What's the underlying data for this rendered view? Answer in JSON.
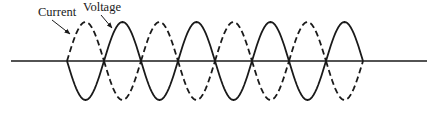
{
  "figure": {
    "type": "waveform-diagram",
    "labels": {
      "current": "Current",
      "voltage": "Voltage"
    },
    "colors": {
      "stroke": "#1a1a1a",
      "background": "#ffffff"
    },
    "axis": {
      "x_start": 11,
      "x_end": 427,
      "y": 61
    },
    "amplitude": {
      "top_y": 22,
      "bottom_y": 100
    },
    "crossings": [
      67,
      104,
      141,
      178,
      215,
      252,
      289,
      326,
      363
    ],
    "series": [
      {
        "name": "Current",
        "style": "dashed",
        "first_lobe": "up"
      },
      {
        "name": "Voltage",
        "style": "solid",
        "first_lobe": "down"
      }
    ],
    "arrows": [
      {
        "for": "Current",
        "from": [
          52,
          20
        ],
        "to": [
          70,
          34
        ]
      },
      {
        "for": "Voltage",
        "from": [
          101,
          15
        ],
        "to": [
          112,
          28
        ]
      }
    ]
  }
}
